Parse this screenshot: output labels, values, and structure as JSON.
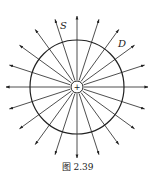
{
  "diagram": {
    "center": {
      "x": 77,
      "y": 87
    },
    "charge_radius": 6,
    "charge_sign": "+",
    "surface_radius": 47,
    "ray_inner": 7,
    "ray_outer": 71,
    "ray_count": 20,
    "stroke_color": "#222222",
    "labels": {
      "surface": "S",
      "field": "D"
    }
  },
  "caption": "图 2.39"
}
